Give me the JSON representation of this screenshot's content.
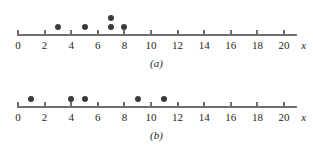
{
  "figure": {
    "axis_name": "x",
    "dot_color": "#3b3b3b",
    "axis_color": "#6f6f6f"
  },
  "chart_data": [
    {
      "type": "scatter",
      "panel": "(a)",
      "title": "",
      "xlabel": "x",
      "ylabel": "",
      "xlim": [
        0,
        21
      ],
      "xticks": [
        0,
        2,
        4,
        6,
        8,
        10,
        12,
        14,
        16,
        18,
        20
      ],
      "xtick_labels": [
        "0",
        "2",
        "4",
        "6",
        "8",
        "10",
        "12",
        "14",
        "16",
        "18",
        "20"
      ],
      "grid": false,
      "legend": "none",
      "values": [
        3,
        5,
        7,
        7,
        8
      ],
      "points": [
        {
          "x": 3,
          "stack": 1
        },
        {
          "x": 5,
          "stack": 1
        },
        {
          "x": 7,
          "stack": 1
        },
        {
          "x": 7,
          "stack": 2
        },
        {
          "x": 8,
          "stack": 1
        }
      ],
      "n": 5
    },
    {
      "type": "scatter",
      "panel": "(b)",
      "title": "",
      "xlabel": "x",
      "ylabel": "",
      "xlim": [
        0,
        21
      ],
      "xticks": [
        0,
        2,
        4,
        6,
        8,
        10,
        12,
        14,
        16,
        18,
        20
      ],
      "xtick_labels": [
        "0",
        "2",
        "4",
        "6",
        "8",
        "10",
        "12",
        "14",
        "16",
        "18",
        "20"
      ],
      "grid": false,
      "legend": "none",
      "values": [
        1,
        4,
        5,
        9,
        11
      ],
      "points": [
        {
          "x": 1,
          "stack": 1
        },
        {
          "x": 4,
          "stack": 1
        },
        {
          "x": 5,
          "stack": 1
        },
        {
          "x": 9,
          "stack": 1
        },
        {
          "x": 11,
          "stack": 1
        }
      ],
      "n": 5
    }
  ],
  "panels": [
    {
      "id": "a",
      "label": "(a)"
    },
    {
      "id": "b",
      "label": "(b)"
    }
  ]
}
